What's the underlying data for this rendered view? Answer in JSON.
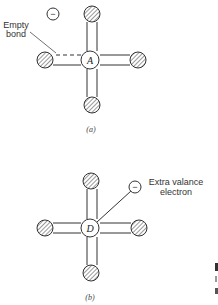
{
  "figure": {
    "panel_a": {
      "caption": "(a)",
      "center_label": "A",
      "electron_symbol": "−",
      "annotation": {
        "line1": "Empty",
        "line2": "bond"
      }
    },
    "panel_b": {
      "caption": "(b)",
      "center_label": "D",
      "electron_symbol": "−",
      "annotation": {
        "line1": "Extra valance",
        "line2": "electron"
      }
    },
    "colors": {
      "stroke": "#333333",
      "hatch": "#555555",
      "background": "#ffffff"
    }
  }
}
